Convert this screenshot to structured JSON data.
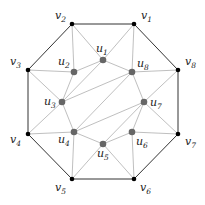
{
  "diagram": {
    "type": "graph",
    "colors": {
      "outer_edge": "#333333",
      "inner_edge": "#b8b8b8",
      "outer_vertex": "#000000",
      "inner_vertex": "#666666"
    },
    "outer_vertices": [
      {
        "id": "v1",
        "name": "v",
        "sub": "1",
        "x": 134,
        "y": 24,
        "lx": 141,
        "ly": 19
      },
      {
        "id": "v2",
        "name": "v",
        "sub": "2",
        "x": 72,
        "y": 24,
        "lx": 55,
        "ly": 19
      },
      {
        "id": "v3",
        "name": "v",
        "sub": "3",
        "x": 28,
        "y": 70,
        "lx": 10,
        "ly": 65
      },
      {
        "id": "v4",
        "name": "v",
        "sub": "4",
        "x": 28,
        "y": 134,
        "lx": 10,
        "ly": 143
      },
      {
        "id": "v5",
        "name": "v",
        "sub": "5",
        "x": 72,
        "y": 179,
        "lx": 55,
        "ly": 191
      },
      {
        "id": "v6",
        "name": "v",
        "sub": "6",
        "x": 134,
        "y": 179,
        "lx": 140,
        "ly": 191
      },
      {
        "id": "v7",
        "name": "v",
        "sub": "7",
        "x": 178,
        "y": 134,
        "lx": 185,
        "ly": 145
      },
      {
        "id": "v8",
        "name": "v",
        "sub": "8",
        "x": 178,
        "y": 70,
        "lx": 185,
        "ly": 65
      }
    ],
    "inner_vertices": [
      {
        "id": "u1",
        "name": "u",
        "sub": "1",
        "x": 103,
        "y": 60,
        "lx": 96,
        "ly": 52
      },
      {
        "id": "u2",
        "name": "u",
        "sub": "2",
        "x": 74,
        "y": 72,
        "lx": 58,
        "ly": 65
      },
      {
        "id": "u3",
        "name": "u",
        "sub": "3",
        "x": 62,
        "y": 102,
        "lx": 44,
        "ly": 105
      },
      {
        "id": "u4",
        "name": "u",
        "sub": "4",
        "x": 74,
        "y": 132,
        "lx": 58,
        "ly": 143
      },
      {
        "id": "u5",
        "name": "u",
        "sub": "5",
        "x": 103,
        "y": 144,
        "lx": 97,
        "ly": 157
      },
      {
        "id": "u6",
        "name": "u",
        "sub": "6",
        "x": 132,
        "y": 132,
        "lx": 136,
        "ly": 145
      },
      {
        "id": "u7",
        "name": "u",
        "sub": "7",
        "x": 144,
        "y": 102,
        "lx": 150,
        "ly": 106
      },
      {
        "id": "u8",
        "name": "u",
        "sub": "8",
        "x": 132,
        "y": 72,
        "lx": 137,
        "ly": 67
      }
    ],
    "outer_edges": [
      [
        "v1",
        "v2"
      ],
      [
        "v2",
        "v3"
      ],
      [
        "v3",
        "v4"
      ],
      [
        "v4",
        "v5"
      ],
      [
        "v5",
        "v6"
      ],
      [
        "v6",
        "v7"
      ],
      [
        "v7",
        "v8"
      ],
      [
        "v8",
        "v1"
      ]
    ],
    "inner_edges": [
      [
        "u1",
        "u2"
      ],
      [
        "u2",
        "u3"
      ],
      [
        "u3",
        "u4"
      ],
      [
        "u4",
        "u5"
      ],
      [
        "u5",
        "u6"
      ],
      [
        "u6",
        "u7"
      ],
      [
        "u7",
        "u8"
      ],
      [
        "u8",
        "u1"
      ],
      [
        "u1",
        "u3"
      ],
      [
        "u3",
        "u8"
      ],
      [
        "u8",
        "u4"
      ],
      [
        "u4",
        "u7"
      ],
      [
        "u7",
        "u5"
      ],
      [
        "v1",
        "u1"
      ],
      [
        "v1",
        "u8"
      ],
      [
        "v2",
        "u1"
      ],
      [
        "v2",
        "u2"
      ],
      [
        "v3",
        "u2"
      ],
      [
        "v3",
        "u3"
      ],
      [
        "v4",
        "u3"
      ],
      [
        "v4",
        "u4"
      ],
      [
        "v5",
        "u4"
      ],
      [
        "v5",
        "u5"
      ],
      [
        "v6",
        "u5"
      ],
      [
        "v6",
        "u6"
      ],
      [
        "v7",
        "u6"
      ],
      [
        "v7",
        "u7"
      ],
      [
        "v8",
        "u7"
      ],
      [
        "v8",
        "u8"
      ]
    ]
  }
}
